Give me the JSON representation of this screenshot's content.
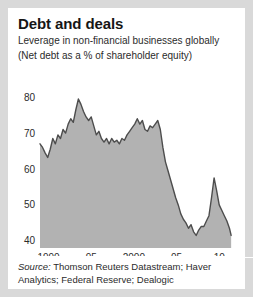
{
  "card": {
    "title": "Debt and deals",
    "subtitle_line1": "Leverage in non-financial businesses globally",
    "subtitle_line2": "(Net debt as a % of shareholder equity)",
    "source_prefix": "Source:",
    "source_text": " Thomson Reuters Datastream; Haver Analytics; Federal Reserve; Dealogic"
  },
  "colors": {
    "page_background": "#d9d9d9",
    "card_background": "#ffffff",
    "area_fill": "#b2b2b2",
    "line": "#4d4d4d",
    "gridline": "#d0d0d0",
    "axis_text": "#2b2b2b",
    "title_text": "#161616"
  },
  "chart_data": {
    "type": "area",
    "title": "Debt and deals",
    "subtitle": "Leverage in non-financial businesses globally (Net debt as a % of shareholder equity)",
    "xlabel": "",
    "ylabel": "",
    "xlim": [
      1989.0,
      2011.5
    ],
    "ylim": [
      38,
      82
    ],
    "yticks": [
      40,
      50,
      60,
      70,
      80
    ],
    "ytick_labels": [
      "40",
      "50",
      "60",
      "70",
      "80"
    ],
    "xticks": [
      1990,
      1995,
      2000,
      2005,
      2010
    ],
    "xtick_labels": [
      "1990",
      "95",
      "2000",
      "05",
      "10"
    ],
    "grid": true,
    "grid_axis": "y",
    "legend": false,
    "series": [
      {
        "name": "Net debt as a % of shareholder equity",
        "x": [
          1989.0,
          1989.3,
          1989.6,
          1989.9,
          1990.2,
          1990.5,
          1990.8,
          1991.1,
          1991.4,
          1991.7,
          1992.0,
          1992.3,
          1992.6,
          1992.9,
          1993.2,
          1993.5,
          1993.8,
          1994.1,
          1994.4,
          1994.7,
          1995.0,
          1995.3,
          1995.6,
          1995.9,
          1996.2,
          1996.5,
          1996.8,
          1997.1,
          1997.4,
          1997.7,
          1998.0,
          1998.3,
          1998.6,
          1998.9,
          1999.2,
          1999.5,
          1999.8,
          2000.1,
          2000.4,
          2000.7,
          2001.0,
          2001.3,
          2001.6,
          2001.9,
          2002.2,
          2002.5,
          2002.8,
          2003.1,
          2003.4,
          2003.7,
          2004.0,
          2004.3,
          2004.6,
          2004.9,
          2005.2,
          2005.5,
          2005.8,
          2006.1,
          2006.4,
          2006.7,
          2007.0,
          2007.3,
          2007.6,
          2007.9,
          2008.2,
          2008.5,
          2008.8,
          2009.1,
          2009.4,
          2009.7,
          2010.0,
          2010.3,
          2010.6,
          2010.9,
          2011.2,
          2011.4
        ],
        "values": [
          67.0,
          66.0,
          64.5,
          63.2,
          65.5,
          68.5,
          67.0,
          69.5,
          68.5,
          71.0,
          70.0,
          72.5,
          74.0,
          73.0,
          76.5,
          79.5,
          78.0,
          76.0,
          74.5,
          73.5,
          74.5,
          72.0,
          69.5,
          70.5,
          68.5,
          67.5,
          68.5,
          67.0,
          68.5,
          67.5,
          68.0,
          67.0,
          68.5,
          68.0,
          69.5,
          70.5,
          71.5,
          72.5,
          74.0,
          72.5,
          73.5,
          71.0,
          70.5,
          72.0,
          71.5,
          72.5,
          73.5,
          71.0,
          66.0,
          62.0,
          59.5,
          57.0,
          54.5,
          52.0,
          50.0,
          47.5,
          46.0,
          45.0,
          43.5,
          44.5,
          42.5,
          41.5,
          43.0,
          44.0,
          44.0,
          45.5,
          47.0,
          52.0,
          57.5,
          54.0,
          50.0,
          48.5,
          47.0,
          45.5,
          43.5,
          41.5
        ]
      }
    ],
    "annotations": {
      "peak_value": 79.5,
      "peak_year": 1993.5,
      "trough_value": 41.5,
      "trough_year": 2007.3,
      "secondary_peak_value": 57.5,
      "secondary_peak_year": 2009.4,
      "final_value": 41.5,
      "final_year": 2011.4
    }
  }
}
